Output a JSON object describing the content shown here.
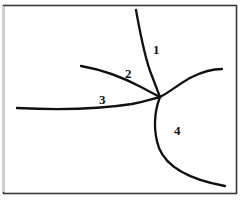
{
  "figure": {
    "kind": "line-diagram",
    "background_color": "#ffffff",
    "stroke_color": "#111111",
    "frame_color": "#3a3a3a",
    "branch_point": {
      "x": 160,
      "y": 97
    },
    "frame": {
      "x": 3,
      "y": 5,
      "width": 233,
      "height": 188
    },
    "labels": [
      {
        "id": "label-1",
        "text": "1",
        "x": 156,
        "y": 49
      },
      {
        "id": "label-2",
        "text": "2",
        "x": 128,
        "y": 73
      },
      {
        "id": "label-3",
        "text": "3",
        "x": 102,
        "y": 99
      },
      {
        "id": "label-4",
        "text": "4",
        "x": 177,
        "y": 130
      }
    ],
    "branches": [
      {
        "label": "1",
        "name": "branch-1",
        "from": {
          "x": 136,
          "y": 10
        },
        "to": {
          "x": 160,
          "y": 97
        },
        "path": "M 136 10 C 141 38 146 62 152 76 C 155 84 158 92 160 97"
      },
      {
        "label": "2",
        "name": "branch-2",
        "from": {
          "x": 81,
          "y": 66
        },
        "to": {
          "x": 160,
          "y": 97
        },
        "path": "M 81 66 C 104 70 124 78 141 87 C 150 92 156 95 160 97"
      },
      {
        "label": "3",
        "name": "branch-3",
        "from": {
          "x": 17,
          "y": 108
        },
        "to": {
          "x": 160,
          "y": 97
        },
        "path": "M 17 108 C 56 110 100 109 132 104 C 147 101 155 98 160 97"
      },
      {
        "label": "",
        "name": "branch-upper-right",
        "from": {
          "x": 160,
          "y": 97
        },
        "to": {
          "x": 222,
          "y": 69
        },
        "path": "M 160 97 C 170 92 180 83 192 77 C 204 71 214 69 222 69"
      },
      {
        "label": "4",
        "name": "branch-4",
        "from": {
          "x": 160,
          "y": 97
        },
        "to": {
          "x": 225,
          "y": 186
        },
        "path": "M 160 97 C 154 112 153 131 159 148 C 167 168 192 180 225 186"
      }
    ]
  }
}
